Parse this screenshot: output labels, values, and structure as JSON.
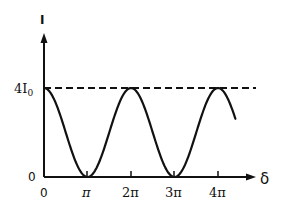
{
  "chart_data": {
    "type": "line",
    "title": "",
    "xlabel": "δ",
    "ylabel": "I",
    "x_ticks": [
      "0",
      "π",
      "2π",
      "3π",
      "4π"
    ],
    "y_ticks": [
      "0",
      "4I₀"
    ],
    "y_tick_main": "4I",
    "y_tick_sub": "0",
    "xlim": [
      0,
      4.6
    ],
    "ylim": [
      0,
      4
    ],
    "grid": false,
    "legend": null,
    "series": [
      {
        "name": "I(δ) = 4I₀ cos²(δ/2)",
        "x_units": "π",
        "x": [
          0,
          0.5,
          1,
          1.5,
          2,
          2.5,
          3,
          3.5,
          4,
          4.4
        ],
        "y": [
          4,
          2,
          0,
          2,
          4,
          2,
          0,
          2,
          4,
          3.62
        ]
      }
    ],
    "annotations": [
      {
        "type": "dashed-horizontal-line",
        "y": 4,
        "label": "4I₀ maximum"
      }
    ]
  },
  "labels": {
    "y_axis": "I",
    "x_axis": "δ",
    "origin_y": "0",
    "tick_0": "0",
    "tick_pi": "π",
    "tick_2pi": "2π",
    "tick_3pi": "3π",
    "tick_4pi": "4π",
    "max_main": "4I",
    "max_sub": "0"
  },
  "colors": {
    "ink": "#111111",
    "background": "#ffffff"
  }
}
